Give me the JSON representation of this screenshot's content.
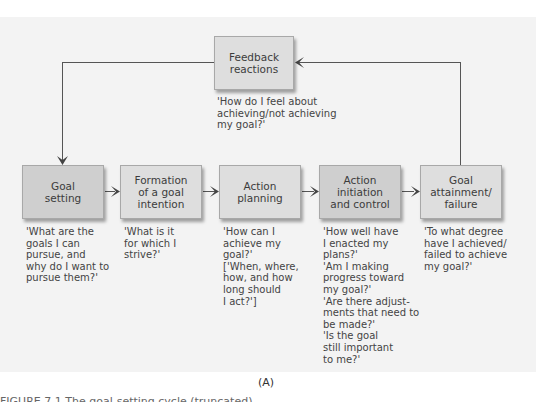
{
  "diagram": {
    "nodes": [
      {
        "id": "feedback",
        "label": "Feedback\nreactions",
        "question": "'How do I feel about\nachieving/not achieving\nmy goal?'"
      },
      {
        "id": "goal-setting",
        "label": "Goal\nsetting",
        "question": "'What are the\ngoals I can\npursue, and\nwhy do I want to\npursue them?'"
      },
      {
        "id": "formation",
        "label": "Formation\nof a goal\nintention",
        "question": "'What is it\nfor which I\nstrive?'"
      },
      {
        "id": "action-planning",
        "label": "Action\nplanning",
        "question": "'How can I\nachieve my\ngoal?'\n['When, where,\nhow, and how\nlong should\nI act?']"
      },
      {
        "id": "action-initiation",
        "label": "Action\ninitiation\nand control",
        "question": "'How well have\nI enacted my\nplans?'\n'Am I making\nprogress toward\nmy goal?'\n'Are there adjust-\nments that need to\nbe made?'\n'Is the goal\nstill important\nto me?'"
      },
      {
        "id": "goal-attainment",
        "label": "Goal\nattainment/\nfailure",
        "question": "'To what degree\nhave I achieved/\nfailed to achieve\nmy goal?'"
      }
    ],
    "edges": [
      {
        "from": "goal-setting",
        "to": "formation"
      },
      {
        "from": "formation",
        "to": "action-planning"
      },
      {
        "from": "action-planning",
        "to": "action-initiation"
      },
      {
        "from": "action-initiation",
        "to": "goal-attainment"
      },
      {
        "from": "goal-attainment",
        "to": "feedback"
      },
      {
        "from": "feedback",
        "to": "goal-setting"
      }
    ],
    "panel_label": "(A)",
    "caption_partial": "FIGURE 7.1  The goal-setting cycle (truncated)"
  },
  "colors": {
    "panel_bg": "#f3f3f3",
    "box_fill": "#dedede",
    "box_fill_dark": "#cfcfcf",
    "line": "#555555"
  }
}
